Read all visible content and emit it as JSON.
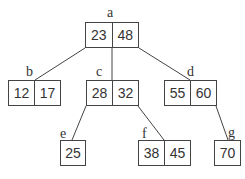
{
  "diagram": {
    "type": "B-tree",
    "nodes": [
      {
        "id": "a",
        "label": "a",
        "keys": [
          "23",
          "48"
        ]
      },
      {
        "id": "b",
        "label": "b",
        "keys": [
          "12",
          "17"
        ]
      },
      {
        "id": "c",
        "label": "c",
        "keys": [
          "28",
          "32"
        ]
      },
      {
        "id": "d",
        "label": "d",
        "keys": [
          "55",
          "60"
        ]
      },
      {
        "id": "e",
        "label": "e",
        "keys": [
          "25"
        ]
      },
      {
        "id": "f",
        "label": "f",
        "keys": [
          "38",
          "45"
        ]
      },
      {
        "id": "g",
        "label": "g",
        "keys": [
          "70"
        ]
      }
    ],
    "edges": [
      {
        "from": "a",
        "to": "b"
      },
      {
        "from": "a",
        "to": "c"
      },
      {
        "from": "a",
        "to": "d"
      },
      {
        "from": "c",
        "to": "e"
      },
      {
        "from": "c",
        "to": "f"
      },
      {
        "from": "d",
        "to": "g"
      }
    ],
    "colors": {
      "stroke": "#444444",
      "text": "#333333",
      "background": "#ffffff"
    }
  }
}
